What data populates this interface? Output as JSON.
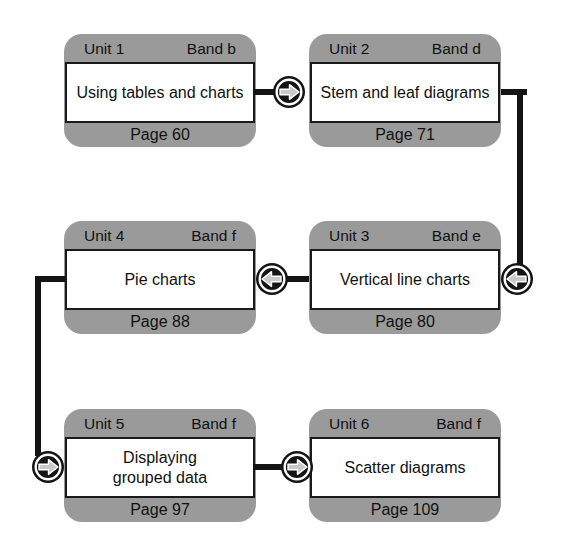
{
  "diagram_title": "Unit sequence flowchart",
  "colors": {
    "background": "#ffffff",
    "card_fill": "#9a9a9a",
    "card_text": "#111111",
    "band_fill": "#ffffff",
    "band_border": "#1a1a1a",
    "connector": "#141414",
    "arrow_glyph_fill": "#c9c9c9",
    "arrow_glyph_outline": "#ffffff"
  },
  "units": [
    {
      "unit_label": "Unit 1",
      "band_label": "Band b",
      "title": "Using tables and charts",
      "page_label": "Page 60"
    },
    {
      "unit_label": "Unit 2",
      "band_label": "Band d",
      "title": "Stem and leaf diagrams",
      "page_label": "Page 71"
    },
    {
      "unit_label": "Unit 3",
      "band_label": "Band e",
      "title": "Vertical line charts",
      "page_label": "Page 80"
    },
    {
      "unit_label": "Unit 4",
      "band_label": "Band f",
      "title": "Pie charts",
      "page_label": "Page 88"
    },
    {
      "unit_label": "Unit 5",
      "band_label": "Band f",
      "title": "Displaying\ngrouped data",
      "page_label": "Page 97"
    },
    {
      "unit_label": "Unit 6",
      "band_label": "Band f",
      "title": "Scatter diagrams",
      "page_label": "Page 109"
    }
  ],
  "connectors": [
    {
      "from": "Unit 1",
      "to": "Unit 2",
      "direction": "right",
      "route": "straight"
    },
    {
      "from": "Unit 2",
      "to": "Unit 3",
      "direction": "left",
      "route": "down-right-side"
    },
    {
      "from": "Unit 3",
      "to": "Unit 4",
      "direction": "left",
      "route": "straight"
    },
    {
      "from": "Unit 4",
      "to": "Unit 5",
      "direction": "right",
      "route": "down-left-side"
    },
    {
      "from": "Unit 5",
      "to": "Unit 6",
      "direction": "right",
      "route": "straight"
    }
  ]
}
